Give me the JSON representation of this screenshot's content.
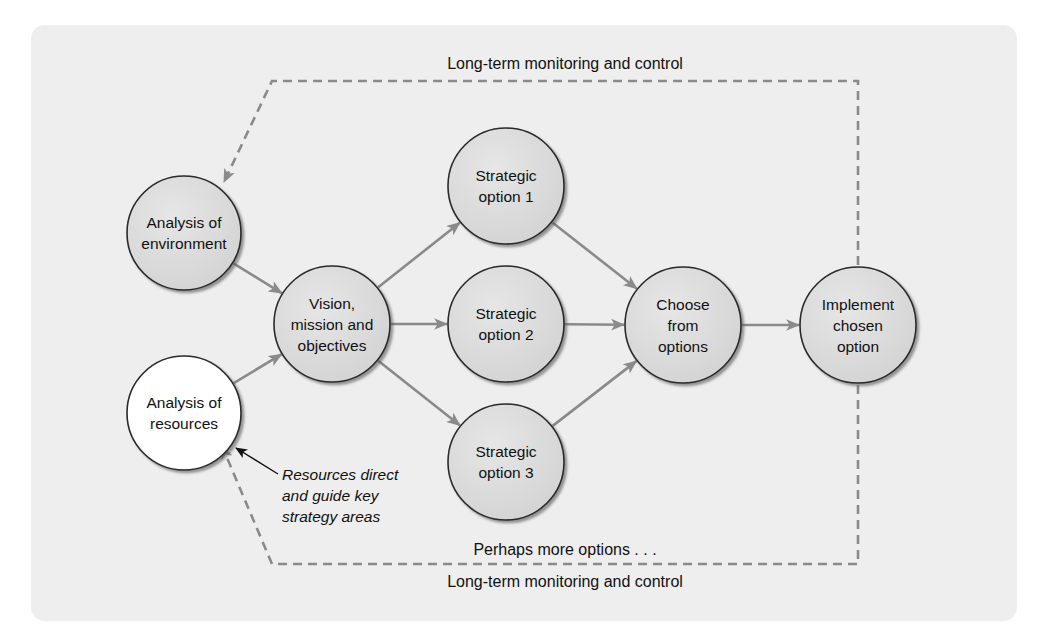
{
  "diagram": {
    "colors": {
      "panel_bg": "#eeeeee",
      "node_fill": "#dcdcdc",
      "node_fill_highlight": "#ffffff",
      "node_stroke": "#2a2a2a",
      "arrow": "#8a8a8a",
      "note_arrow": "#111111"
    },
    "top_label": "Long-term monitoring and control",
    "bottom_label": "Long-term monitoring and control",
    "more_options_label": "Perhaps more options . . .",
    "note": {
      "lines": [
        "Resources direct",
        "and guide key",
        "strategy areas"
      ]
    },
    "nodes": [
      {
        "id": "env",
        "lines": [
          "Analysis of",
          "environment"
        ],
        "cx": 184,
        "cy": 233,
        "r": 57,
        "fill": "grey"
      },
      {
        "id": "res",
        "lines": [
          "Analysis of",
          "resources"
        ],
        "cx": 184,
        "cy": 413,
        "r": 57,
        "fill": "white"
      },
      {
        "id": "vision",
        "lines": [
          "Vision,",
          "mission and",
          "objectives"
        ],
        "cx": 332,
        "cy": 324,
        "r": 58,
        "fill": "grey"
      },
      {
        "id": "opt1",
        "lines": [
          "Strategic",
          "option 1"
        ],
        "cx": 506,
        "cy": 186,
        "r": 58,
        "fill": "grey"
      },
      {
        "id": "opt2",
        "lines": [
          "Strategic",
          "option 2"
        ],
        "cx": 506,
        "cy": 324,
        "r": 58,
        "fill": "grey"
      },
      {
        "id": "opt3",
        "lines": [
          "Strategic",
          "option 3"
        ],
        "cx": 506,
        "cy": 462,
        "r": 58,
        "fill": "grey"
      },
      {
        "id": "choose",
        "lines": [
          "Choose",
          "from",
          "options"
        ],
        "cx": 683,
        "cy": 325,
        "r": 58,
        "fill": "grey"
      },
      {
        "id": "implement",
        "lines": [
          "Implement",
          "chosen",
          "option"
        ],
        "cx": 858,
        "cy": 325,
        "r": 58,
        "fill": "grey"
      }
    ],
    "edges": [
      {
        "from": "env",
        "to": "vision"
      },
      {
        "from": "res",
        "to": "vision"
      },
      {
        "from": "vision",
        "to": "opt1"
      },
      {
        "from": "vision",
        "to": "opt2"
      },
      {
        "from": "vision",
        "to": "opt3"
      },
      {
        "from": "opt1",
        "to": "choose"
      },
      {
        "from": "opt2",
        "to": "choose"
      },
      {
        "from": "opt3",
        "to": "choose"
      },
      {
        "from": "choose",
        "to": "implement"
      }
    ]
  }
}
